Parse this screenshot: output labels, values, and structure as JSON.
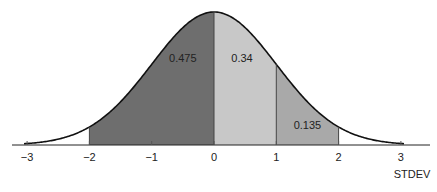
{
  "chart_data": {
    "type": "area",
    "title": "",
    "xlabel": "STDEV",
    "ylabel": "",
    "xlim": [
      -3,
      3
    ],
    "x_ticks": [
      -3,
      -2,
      -1,
      0,
      1,
      2,
      3
    ],
    "x_tick_labels": [
      "−3",
      "−2",
      "−1",
      "0",
      "1",
      "2",
      "3"
    ],
    "curve": "standard normal distribution",
    "shaded_regions": [
      {
        "from": -2,
        "to": 0,
        "label": "0.475",
        "value": 0.475,
        "color": "#6e6e6e"
      },
      {
        "from": 0,
        "to": 1,
        "label": "0.34",
        "value": 0.34,
        "color": "#c8c8c8"
      },
      {
        "from": 1,
        "to": 2,
        "label": "0.135",
        "value": 0.135,
        "color": "#a9a9a9"
      }
    ],
    "grid": false,
    "legend": null
  }
}
